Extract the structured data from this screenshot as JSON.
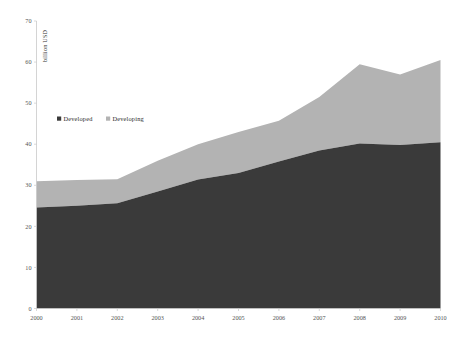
{
  "chart_data": {
    "type": "area",
    "stacked": true,
    "title": "",
    "subtitle": "",
    "xlabel": "",
    "ylabel": "billion USD",
    "categories": [
      "2000",
      "2001",
      "2002",
      "2003",
      "2004",
      "2005",
      "2006",
      "2007",
      "2008",
      "2009",
      "2010"
    ],
    "x": [
      2000,
      2001,
      2002,
      2003,
      2004,
      2005,
      2006,
      2007,
      2008,
      2009,
      2010
    ],
    "series": [
      {
        "name": "Developed",
        "color": "#3a3a3a",
        "values": [
          24.6,
          25.0,
          25.6,
          28.5,
          31.4,
          33.0,
          35.8,
          38.5,
          40.2,
          39.8,
          40.5
        ]
      },
      {
        "name": "Developing",
        "color": "#b3b3b3",
        "values": [
          6.4,
          6.3,
          5.9,
          7.5,
          8.6,
          10.0,
          9.9,
          13.0,
          19.3,
          17.2,
          20.0
        ]
      }
    ],
    "totals": [
      31.0,
      31.3,
      31.5,
      36.0,
      40.0,
      43.0,
      45.7,
      51.5,
      59.5,
      57.0,
      60.5
    ],
    "ylim": [
      0,
      70
    ],
    "yticks": [
      0,
      10,
      20,
      30,
      40,
      50,
      60,
      70
    ],
    "ytick_labels": [
      "0",
      "10",
      "20",
      "30",
      "40",
      "50",
      "60",
      "70"
    ],
    "xtick_labels": [
      "2000",
      "2001",
      "2002",
      "2003",
      "2004",
      "2005",
      "2006",
      "2007",
      "2008",
      "2009",
      "2010"
    ],
    "grid": false,
    "legend_position": "inside-upper-left",
    "legend_entries": [
      {
        "label": "Developed",
        "color": "#3a3a3a",
        "marker": "square"
      },
      {
        "label": "Developing",
        "color": "#b3b3b3",
        "marker": "square"
      }
    ]
  },
  "axis": {
    "y_title": "billion USD"
  }
}
